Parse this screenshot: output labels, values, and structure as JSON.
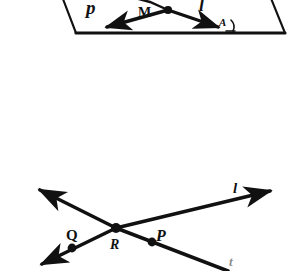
{
  "page": {
    "background_color": "#ffffff",
    "ink_color": "#111111",
    "width": 290,
    "height": 271
  },
  "figures": [
    {
      "id": "plane-figure",
      "name": "plane-with-rays-figure",
      "caption": "Partially cropped parallelogram representing a plane, containing labeled points and rays",
      "labels": [
        {
          "name": "ray-p-label",
          "text": "p",
          "x": 86,
          "y": -2,
          "size": 19,
          "italic": true
        },
        {
          "name": "point-m-label",
          "text": "M",
          "x": 138,
          "y": 6,
          "size": 14,
          "italic": false
        },
        {
          "name": "ray-l-label",
          "text": "l",
          "x": 199,
          "y": -4,
          "size": 18,
          "italic": true
        },
        {
          "name": "plane-script-label",
          "text": "A",
          "x": 219,
          "y": 17,
          "size": 11,
          "italic": true
        }
      ]
    },
    {
      "id": "intersecting-lines-figure",
      "name": "two-intersecting-lines-figure",
      "caption": "Two lines crossing at point R with arrowheads on all four ends; points Q and P marked",
      "labels": [
        {
          "name": "point-q-label",
          "text": "Q",
          "x": 66,
          "y": 228,
          "size": 15,
          "italic": false
        },
        {
          "name": "point-r-label",
          "text": "R",
          "x": 110,
          "y": 238,
          "size": 14,
          "italic": true
        },
        {
          "name": "point-p-label",
          "text": "P",
          "x": 156,
          "y": 228,
          "size": 16,
          "italic": true
        },
        {
          "name": "line-l-label",
          "text": "l",
          "x": 233,
          "y": 181,
          "size": 15,
          "italic": true
        },
        {
          "name": "line-t-label",
          "text": "t",
          "x": 229,
          "y": 255,
          "size": 13,
          "italic": true
        }
      ],
      "points": [
        {
          "name": "point-q",
          "x": 72,
          "y": 248
        },
        {
          "name": "point-r",
          "x": 116,
          "y": 228
        },
        {
          "name": "point-p",
          "x": 152,
          "y": 242
        }
      ]
    }
  ]
}
